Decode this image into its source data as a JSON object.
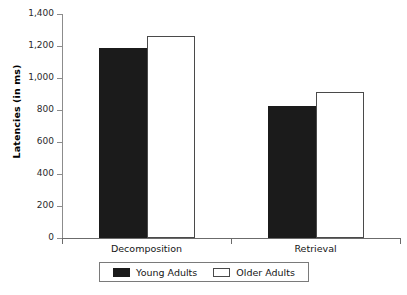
{
  "chart_data": {
    "type": "bar",
    "title": "",
    "xlabel": "",
    "ylabel": "Latencies (in ms)",
    "categories": [
      "Decomposition",
      "Retrieval"
    ],
    "series": [
      {
        "name": "Young Adults",
        "color": "#1b1b1b",
        "values": [
          1190,
          825
        ]
      },
      {
        "name": "Older Adults",
        "color": "#ffffff",
        "values": [
          1265,
          915
        ]
      }
    ],
    "ylim": [
      0,
      1400
    ],
    "ytick_values": [
      1400,
      1200,
      1000,
      800,
      600,
      400,
      200,
      0
    ],
    "ytick_labels": [
      "1,400",
      "1,200",
      "1,000",
      "800",
      "600",
      "400",
      "200",
      "0"
    ],
    "grid": false,
    "legend_position": "bottom"
  },
  "legend": {
    "items": [
      {
        "label": "Young Adults",
        "swatch": "filled-black-swatch"
      },
      {
        "label": "Older Adults",
        "swatch": "open-white-swatch"
      }
    ]
  }
}
